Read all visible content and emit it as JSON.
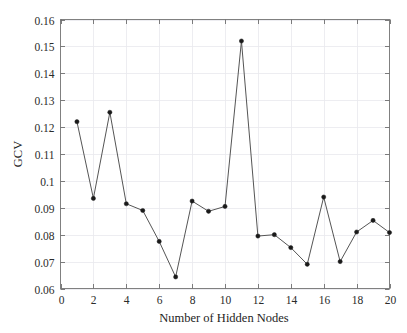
{
  "chart_data": {
    "type": "line",
    "title": "",
    "xlabel": "Number of Hidden Nodes",
    "ylabel": "GCV",
    "xlim": [
      0,
      20
    ],
    "ylim": [
      0.06,
      0.16
    ],
    "grid": true,
    "legend": null,
    "marker": "filled-circle",
    "line_color": "#555555",
    "marker_color": "#1a1a1a",
    "background_color": "#ffffff",
    "x": [
      1,
      2,
      3,
      4,
      5,
      6,
      7,
      8,
      9,
      10,
      11,
      12,
      13,
      14,
      15,
      16,
      17,
      18,
      19,
      20
    ],
    "values": [
      0.122,
      0.0935,
      0.1255,
      0.0915,
      0.089,
      0.0775,
      0.0643,
      0.0925,
      0.0887,
      0.0905,
      0.152,
      0.0795,
      0.08,
      0.0752,
      0.069,
      0.094,
      0.07,
      0.081,
      0.0853,
      0.0808
    ],
    "xticks": [
      0,
      2,
      4,
      6,
      8,
      10,
      12,
      14,
      16,
      18,
      20
    ],
    "xticklabels": [
      "0",
      "2",
      "4",
      "6",
      "8",
      "10",
      "12",
      "14",
      "16",
      "18",
      "20"
    ],
    "yticks": [
      0.06,
      0.07,
      0.08,
      0.09,
      0.1,
      0.11,
      0.12,
      0.13,
      0.14,
      0.15,
      0.16
    ],
    "yticklabels": [
      "0.06",
      "0.07",
      "0.08",
      "0.09",
      "0.1",
      "0.11",
      "0.12",
      "0.13",
      "0.14",
      "0.15",
      "0.16"
    ]
  }
}
